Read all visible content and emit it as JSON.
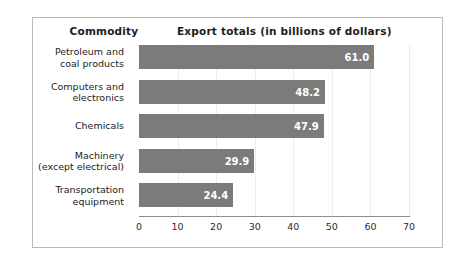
{
  "figure": {
    "header_commodity": "Commodity",
    "header_export": "Export totals (in billions of dollars)"
  },
  "chart_data": {
    "type": "bar",
    "orientation": "horizontal",
    "title": "Export totals (in billions of dollars)",
    "xlabel": "",
    "ylabel": "Commodity",
    "categories": [
      "Petroleum and coal products",
      "Computers and electronics",
      "Chemicals",
      "Machinery (except electrical)",
      "Transportation equipment"
    ],
    "category_lines": [
      [
        "Petroleum and",
        "coal products"
      ],
      [
        "Computers and",
        "electronics"
      ],
      [
        "Chemicals"
      ],
      [
        "Machinery",
        "(except electrical)"
      ],
      [
        "Transportation",
        "equipment"
      ]
    ],
    "values": [
      61.0,
      48.2,
      47.9,
      29.9,
      24.4
    ],
    "value_labels": [
      "61.0",
      "48.2",
      "47.9",
      "29.9",
      "24.4"
    ],
    "xlim": [
      0,
      70
    ],
    "xticks": [
      0,
      10,
      20,
      30,
      40,
      50,
      60,
      70
    ],
    "xtick_labels": [
      "0",
      "10",
      "20",
      "30",
      "40",
      "50",
      "60",
      "70"
    ],
    "grid": true,
    "legend": null,
    "bar_color": "#7b7b7b",
    "value_label_color": "#ffffff",
    "gridline_color": "#ececec",
    "axis_color": "#8d8d8d",
    "border_color": "#b9b9b9"
  }
}
